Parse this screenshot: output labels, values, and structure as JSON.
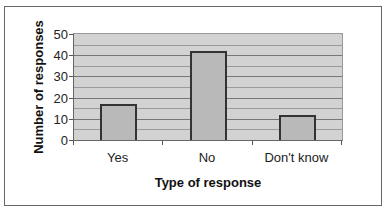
{
  "chart_data": {
    "type": "bar",
    "title": "",
    "categories": [
      "Yes",
      "No",
      "Don't know"
    ],
    "values": [
      17,
      42,
      12
    ],
    "xlabel": "Type of response",
    "ylabel": "Number of responses",
    "ylim": [
      0,
      50
    ],
    "yticks": [
      "0",
      "10",
      "20",
      "30",
      "40",
      "50"
    ],
    "grid": true,
    "legend": null,
    "colors": {
      "bar": "#b9b9b9",
      "plot_bg": "#d2d2d2",
      "bar_border": "#333333"
    }
  }
}
